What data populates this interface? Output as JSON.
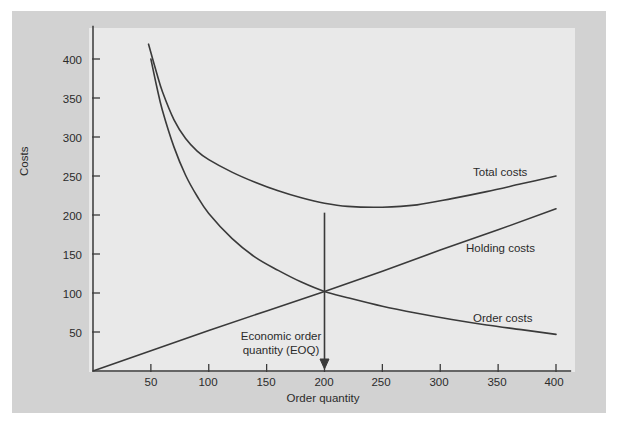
{
  "figure": {
    "background_color": "#ffffff",
    "panel_color": "#d2d2d2",
    "plot_area_color": "#e9e9e9",
    "line_color": "#3a3a3a",
    "text_color": "#2b2b2b"
  },
  "chart_data": {
    "type": "line",
    "title": "",
    "xlabel": "Order quantity",
    "ylabel": "Costs",
    "xlim": [
      0,
      420
    ],
    "ylim": [
      0,
      440
    ],
    "xticks": [
      50,
      100,
      150,
      200,
      250,
      300,
      350,
      400
    ],
    "xtick_labels": [
      "50",
      "100",
      "150",
      "200",
      "250",
      "300",
      "350",
      "400"
    ],
    "yticks": [
      50,
      100,
      150,
      200,
      250,
      300,
      350,
      400
    ],
    "ytick_labels": [
      "50",
      "100",
      "150",
      "200",
      "250",
      "300",
      "350",
      "400"
    ],
    "grid": false,
    "legend_position": "inline-right-of-curves",
    "series": [
      {
        "name": "Total costs",
        "label": "Total costs",
        "label_x": 330,
        "label_y": 253,
        "x": [
          48,
          55,
          60,
          70,
          80,
          90,
          100,
          120,
          140,
          160,
          180,
          200,
          220,
          250,
          280,
          310,
          340,
          370,
          400
        ],
        "y": [
          419,
          382,
          358,
          322,
          298,
          282,
          271,
          255,
          242,
          231,
          222,
          215,
          211,
          210,
          213,
          221,
          230,
          240,
          250
        ]
      },
      {
        "name": "Holding costs",
        "label": "Holding costs",
        "label_x": 330,
        "label_y": 170,
        "x": [
          0,
          50,
          100,
          150,
          200,
          250,
          300,
          350,
          400
        ],
        "y": [
          0,
          26,
          52,
          77,
          102,
          128,
          155,
          181,
          208
        ]
      },
      {
        "name": "Order costs",
        "label": "Order costs",
        "label_x": 330,
        "label_y": 77,
        "x": [
          50,
          55,
          60,
          70,
          80,
          90,
          100,
          120,
          140,
          160,
          180,
          200,
          220,
          250,
          280,
          310,
          340,
          370,
          400
        ],
        "y": [
          400,
          365,
          334,
          287,
          251,
          224,
          202,
          170,
          146,
          129,
          114,
          102,
          94,
          83,
          74,
          66,
          59,
          53,
          47
        ]
      }
    ],
    "annotations": [
      {
        "name": "eoq-annotation",
        "text_line_1": "Economic order",
        "text_line_2": "quantity (EOQ)",
        "arrow_from": {
          "x": 200,
          "y": 203
        },
        "arrow_to": {
          "x": 200,
          "y": 0
        },
        "intersection": {
          "x": 200,
          "y": 100
        }
      }
    ]
  },
  "labels": {
    "y_axis_title": "Costs",
    "x_axis_title": "Order quantity",
    "eoq_line_1": "Economic order",
    "eoq_line_2": "quantity (EOQ)",
    "total_costs": "Total costs",
    "holding_costs": "Holding costs",
    "order_costs": "Order costs",
    "ytick_400": "400",
    "ytick_350": "350",
    "ytick_300": "300",
    "ytick_250": "250",
    "ytick_200": "200",
    "ytick_150": "150",
    "ytick_100": "100",
    "ytick_50": "50",
    "xtick_50": "50",
    "xtick_100": "100",
    "xtick_150": "150",
    "xtick_200": "200",
    "xtick_250": "250",
    "xtick_300": "300",
    "xtick_350": "350",
    "xtick_400": "400"
  }
}
